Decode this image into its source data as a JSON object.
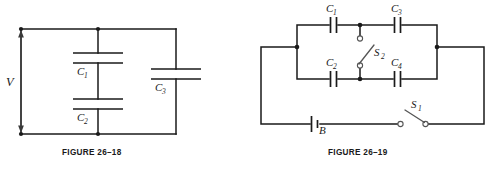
{
  "page": {
    "background_color": "#ffffff",
    "ink_color": "#1a1a1a"
  },
  "figures": [
    {
      "id": "figure-26-18",
      "caption": "FIGURE 26–18",
      "description": "Voltage source V across a series pair of capacitors C1 and C2, in parallel with capacitor C3",
      "labels": {
        "source": "V",
        "c1": "C",
        "c1_sub": "1",
        "c2": "C",
        "c2_sub": "2",
        "c3": "C",
        "c3_sub": "3"
      },
      "components": [
        {
          "name": "voltage-source",
          "label": "V",
          "orientation": "vertical-double-arrow"
        },
        {
          "name": "capacitor-c1",
          "label": "C1",
          "orientation": "horizontal-plates"
        },
        {
          "name": "capacitor-c2",
          "label": "C2",
          "orientation": "horizontal-plates"
        },
        {
          "name": "capacitor-c3",
          "label": "C3",
          "orientation": "horizontal-plates"
        }
      ]
    },
    {
      "id": "figure-26-19",
      "caption": "FIGURE 26–19",
      "description": "Four capacitors C1 C2 C3 C4 in a bridge arrangement with center switch S2, powered by battery B through switch S1",
      "labels": {
        "c1": "C",
        "c1_sub": "1",
        "c2": "C",
        "c2_sub": "2",
        "c3": "C",
        "c3_sub": "3",
        "c4": "C",
        "c4_sub": "4",
        "s1": "S",
        "s1_sub": "1",
        "s2": "S",
        "s2_sub": "2",
        "battery": "B"
      },
      "components": [
        {
          "name": "capacitor-c1",
          "label": "C1",
          "orientation": "vertical-plates"
        },
        {
          "name": "capacitor-c2",
          "label": "C2",
          "orientation": "vertical-plates"
        },
        {
          "name": "capacitor-c3",
          "label": "C3",
          "orientation": "vertical-plates"
        },
        {
          "name": "capacitor-c4",
          "label": "C4",
          "orientation": "vertical-plates"
        },
        {
          "name": "switch-s1",
          "label": "S1",
          "state": "open"
        },
        {
          "name": "switch-s2",
          "label": "S2",
          "state": "open-double-throw"
        },
        {
          "name": "battery-b",
          "label": "B",
          "orientation": "vertical-plates"
        }
      ]
    }
  ]
}
